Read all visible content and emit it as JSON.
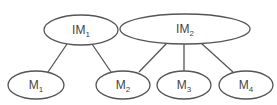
{
  "diagram": {
    "type": "tree",
    "colors": {
      "stroke": "#555555",
      "text": "#444444",
      "background": "#ffffff"
    },
    "nodes": [
      {
        "id": "IM1",
        "base": "IM",
        "sub": "1",
        "cx": 81,
        "cy": 30,
        "rx": 37,
        "ry": 15
      },
      {
        "id": "IM2",
        "base": "IM",
        "sub": "2",
        "cx": 185,
        "cy": 29,
        "rx": 65,
        "ry": 15
      },
      {
        "id": "M1",
        "base": "M",
        "sub": "1",
        "cx": 36,
        "cy": 85,
        "rx": 28,
        "ry": 14
      },
      {
        "id": "M2",
        "base": "M",
        "sub": "2",
        "cx": 123,
        "cy": 85,
        "rx": 27,
        "ry": 14
      },
      {
        "id": "M3",
        "base": "M",
        "sub": "3",
        "cx": 184,
        "cy": 85,
        "rx": 27,
        "ry": 14
      },
      {
        "id": "M4",
        "base": "M",
        "sub": "4",
        "cx": 246,
        "cy": 85,
        "rx": 27,
        "ry": 14
      }
    ],
    "edges": [
      {
        "from": "IM1",
        "to": "M1",
        "x1": 67,
        "y1": 44,
        "x2": 48,
        "y2": 72
      },
      {
        "from": "IM1",
        "to": "M2",
        "x1": 92,
        "y1": 44,
        "x2": 111,
        "y2": 72
      },
      {
        "from": "IM2",
        "to": "M2",
        "x1": 167,
        "y1": 43,
        "x2": 139,
        "y2": 72
      },
      {
        "from": "IM2",
        "to": "M3",
        "x1": 184,
        "y1": 44,
        "x2": 184,
        "y2": 71
      },
      {
        "from": "IM2",
        "to": "M4",
        "x1": 201,
        "y1": 43,
        "x2": 233,
        "y2": 72
      }
    ]
  }
}
